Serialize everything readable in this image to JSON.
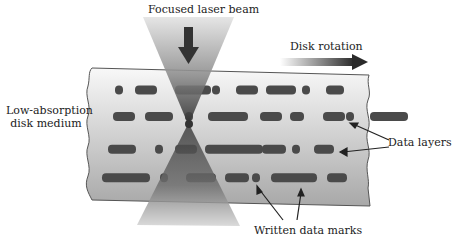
{
  "labels": {
    "beam": "Focused laser beam",
    "rotation": "Disk rotation",
    "medium_line1": "Low-absorption",
    "medium_line2": "disk medium",
    "data_layers": "Data layers",
    "written_marks": "Written data marks"
  },
  "icons": {
    "beam_arrow": "down-arrow-icon",
    "rotation_arrow": "right-arrow-icon"
  },
  "colors": {
    "medium_top": "#f8f8f8",
    "medium_bottom": "#a8a8a8",
    "marks": "#4a4a4a",
    "beam_light": "#d8d8d8",
    "beam_dark": "#3a3a3a",
    "text": "#222222",
    "outline": "#555555"
  },
  "layers": [
    {
      "y": 90,
      "marks": [
        [
          115,
          8
        ],
        [
          135,
          22
        ],
        [
          175,
          36
        ],
        [
          212,
          8
        ],
        [
          236,
          22
        ],
        [
          266,
          30
        ],
        [
          302,
          8
        ],
        [
          326,
          18
        ]
      ]
    },
    {
      "y": 116,
      "marks": [
        [
          113,
          22
        ],
        [
          145,
          28
        ],
        [
          185,
          8
        ],
        [
          208,
          40
        ],
        [
          260,
          22
        ],
        [
          290,
          14
        ],
        [
          323,
          22
        ],
        [
          346,
          8
        ],
        [
          370,
          38
        ]
      ]
    },
    {
      "y": 148,
      "marks": [
        [
          108,
          28
        ],
        [
          155,
          8
        ],
        [
          175,
          22
        ],
        [
          205,
          58
        ],
        [
          262,
          24
        ],
        [
          292,
          8
        ],
        [
          314,
          20
        ]
      ]
    },
    {
      "y": 176,
      "marks": [
        [
          102,
          48
        ],
        [
          160,
          8
        ],
        [
          186,
          30
        ],
        [
          225,
          24
        ],
        [
          252,
          8
        ],
        [
          271,
          46
        ],
        [
          327,
          20
        ]
      ]
    }
  ]
}
